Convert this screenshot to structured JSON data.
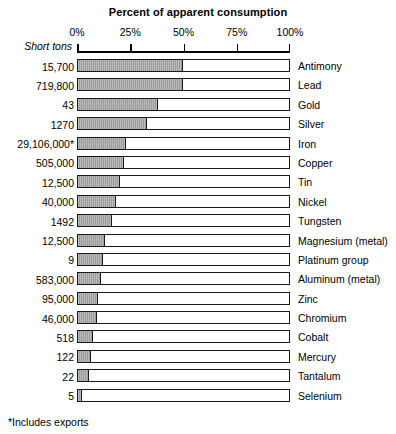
{
  "chart_data": {
    "type": "bar",
    "orientation": "horizontal",
    "title": "Percent of apparent consumption",
    "xlabel": "Percent of apparent consumption",
    "ylabel": "Short tons",
    "xlim": [
      0,
      100
    ],
    "xticks": [
      "0%",
      "25%",
      "50%",
      "75%",
      "100%"
    ],
    "xtick_values": [
      0,
      25,
      50,
      75,
      100
    ],
    "grid": false,
    "legend": null,
    "footnote": "*Includes exports",
    "value_column_header": "Short tons",
    "categories": [
      "Antimony",
      "Lead",
      "Gold",
      "Silver",
      "Iron",
      "Copper",
      "Tin",
      "Nickel",
      "Tungsten",
      "Magnesium (metal)",
      "Platinum group",
      "Aluminum (metal)",
      "Zinc",
      "Chromium",
      "Cobalt",
      "Mercury",
      "Tantalum",
      "Selenium"
    ],
    "values": [
      50,
      50,
      38,
      33,
      23,
      22,
      20,
      18,
      16,
      13,
      12,
      11,
      9.5,
      9,
      7,
      6,
      5,
      2
    ],
    "short_tons": [
      "15,700",
      "719,800",
      "43",
      "1270",
      "29,106,000*",
      "505,000",
      "12,500",
      "40,000",
      "1492",
      "12,500",
      "9",
      "583,000",
      "95,000",
      "46,000",
      "518",
      "122",
      "22",
      "5"
    ],
    "rows": [
      {
        "label": "Antimony",
        "short_tons": "15,700",
        "percent": 50
      },
      {
        "label": "Lead",
        "short_tons": "719,800",
        "percent": 50
      },
      {
        "label": "Gold",
        "short_tons": "43",
        "percent": 38
      },
      {
        "label": "Silver",
        "short_tons": "1270",
        "percent": 33
      },
      {
        "label": "Iron",
        "short_tons": "29,106,000*",
        "percent": 23
      },
      {
        "label": "Copper",
        "short_tons": "505,000",
        "percent": 22
      },
      {
        "label": "Tin",
        "short_tons": "12,500",
        "percent": 20
      },
      {
        "label": "Nickel",
        "short_tons": "40,000",
        "percent": 18
      },
      {
        "label": "Tungsten",
        "short_tons": "1492",
        "percent": 16
      },
      {
        "label": "Magnesium (metal)",
        "short_tons": "12,500",
        "percent": 13
      },
      {
        "label": "Platinum group",
        "short_tons": "9",
        "percent": 12
      },
      {
        "label": "Aluminum (metal)",
        "short_tons": "583,000",
        "percent": 11
      },
      {
        "label": "Zinc",
        "short_tons": "95,000",
        "percent": 9.5
      },
      {
        "label": "Chromium",
        "short_tons": "46,000",
        "percent": 9
      },
      {
        "label": "Cobalt",
        "short_tons": "518",
        "percent": 7
      },
      {
        "label": "Mercury",
        "short_tons": "122",
        "percent": 6
      },
      {
        "label": "Tantalum",
        "short_tons": "22",
        "percent": 5
      },
      {
        "label": "Selenium",
        "short_tons": "5",
        "percent": 2
      }
    ],
    "colors": {
      "bar_fill": "#9c9c9c",
      "bar_outline": "#1a1a1a",
      "background": "#ffffff",
      "text": "#000000"
    }
  }
}
